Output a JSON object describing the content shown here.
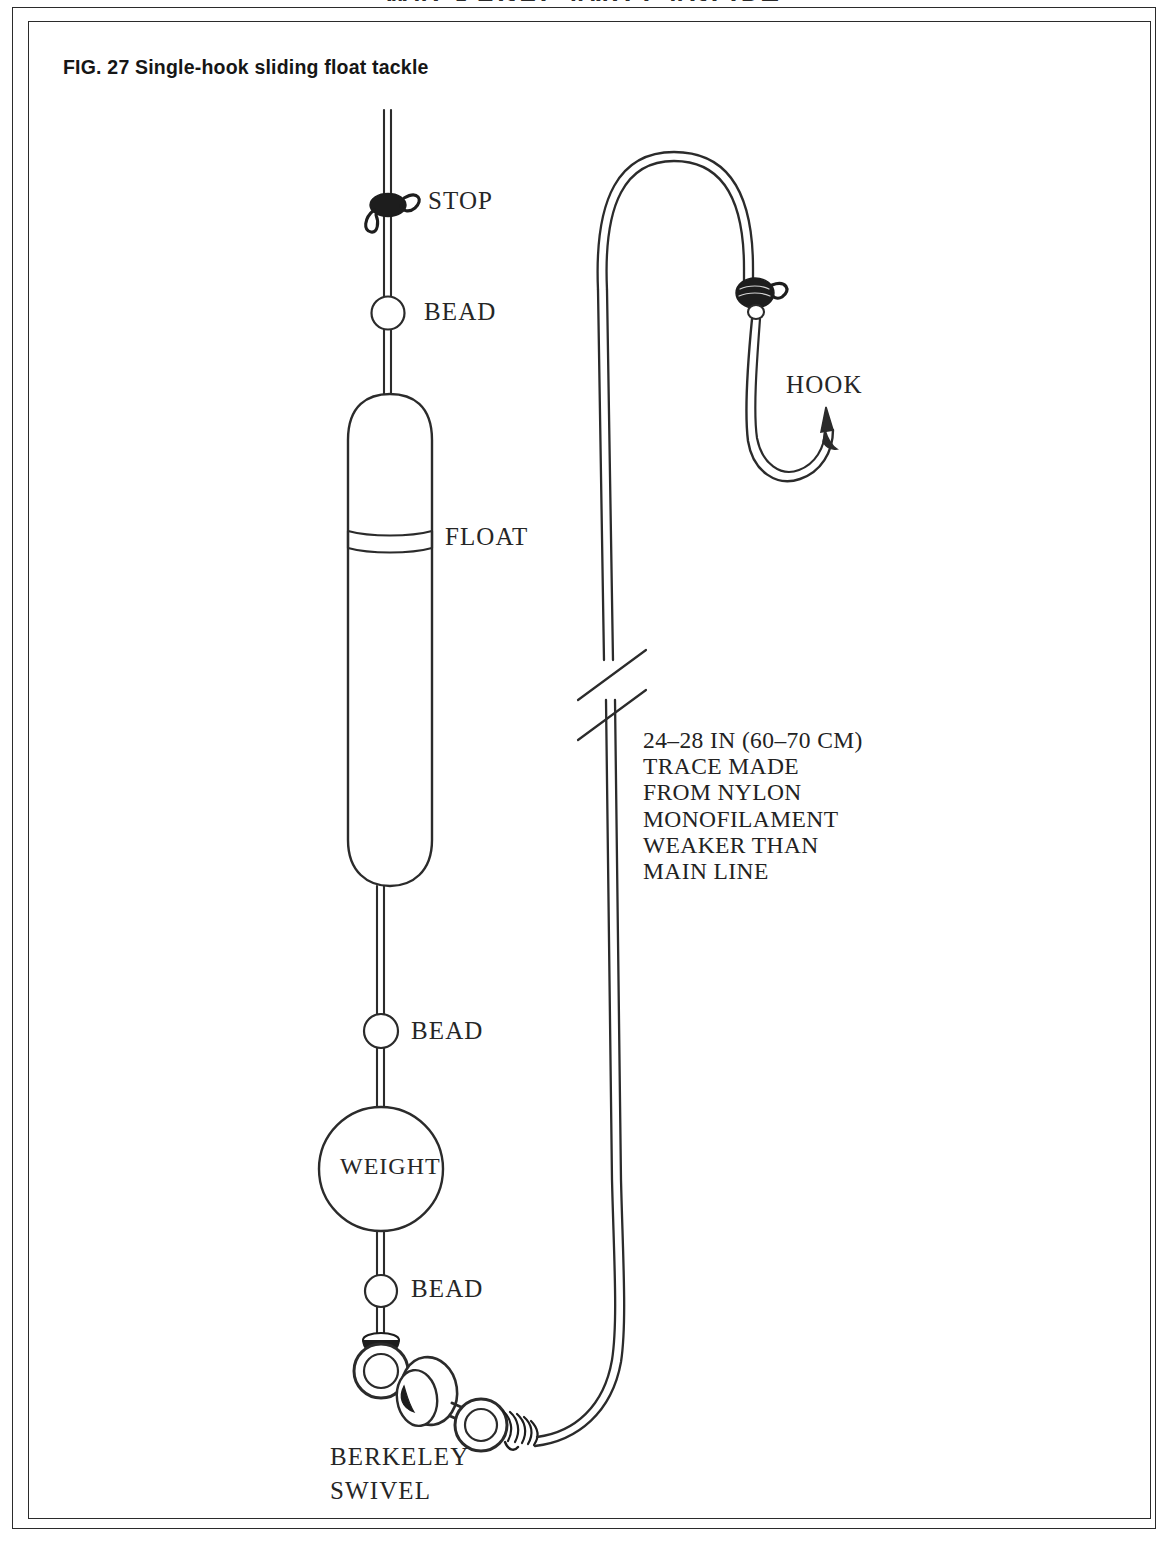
{
  "page": {
    "running_head": "MACKEREL AND GARFISH",
    "figure_title": "FIG. 27 Single-hook sliding float tackle"
  },
  "diagram": {
    "type": "fishing-tackle-rig-diagram",
    "labels": {
      "stop": "STOP",
      "bead_top": "BEAD",
      "float": "FLOAT",
      "bead_middle": "BEAD",
      "weight": "WEIGHT",
      "bead_bottom": "BEAD",
      "swivel_line1": "BERKELEY",
      "swivel_line2": "SWIVEL",
      "hook": "HOOK"
    },
    "annotation": {
      "lines": [
        "24–28 IN (60–70 CM)",
        "TRACE MADE",
        "FROM NYLON",
        "MONOFILAMENT",
        "WEAKER THAN",
        "MAIN LINE"
      ]
    },
    "components": [
      {
        "name": "stop-knot",
        "label": "STOP"
      },
      {
        "name": "bead-upper",
        "label": "BEAD"
      },
      {
        "name": "sliding-float",
        "label": "FLOAT"
      },
      {
        "name": "bead-above-weight",
        "label": "BEAD"
      },
      {
        "name": "weight",
        "label": "WEIGHT"
      },
      {
        "name": "bead-below-weight",
        "label": "BEAD"
      },
      {
        "name": "berkeley-swivel",
        "label": "BERKELEY SWIVEL"
      },
      {
        "name": "hook",
        "label": "HOOK"
      },
      {
        "name": "line-break-marks",
        "label": ""
      }
    ],
    "colors": {
      "ink": "#2b2b2b",
      "knot_fill": "#1d1d1d",
      "background": "#ffffff"
    }
  }
}
